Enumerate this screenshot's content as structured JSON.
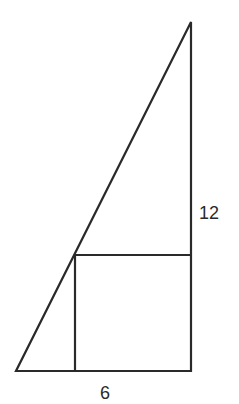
{
  "diagram": {
    "type": "geometry",
    "stroke_color": "#2a2a2a",
    "background": "#ffffff",
    "labels": {
      "height": "12",
      "base": "6"
    },
    "shapes": {
      "triangle": {
        "points": [
          [
            16,
            371
          ],
          [
            191,
            371
          ],
          [
            191,
            22
          ]
        ]
      },
      "square": {
        "x": 75,
        "y": 255,
        "width": 116,
        "height": 116
      }
    }
  }
}
